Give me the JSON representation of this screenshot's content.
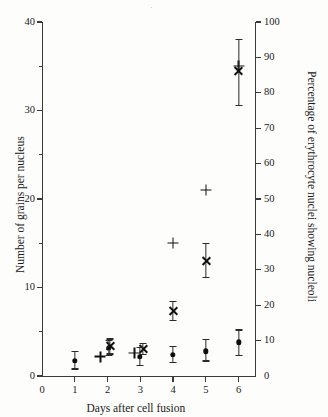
{
  "chart_data": {
    "type": "scatter",
    "title": "",
    "xlabel": "Days after cell fusion",
    "ylabel": "Number of grains per nucleus",
    "ylabel_right": "Percentage of erythrocyte nuclei showing nucleoli",
    "xlim": [
      0,
      6.5
    ],
    "ylim": [
      0,
      40
    ],
    "ylim_right": [
      0,
      100
    ],
    "x_ticks": [
      0,
      1,
      2,
      3,
      4,
      5,
      6
    ],
    "x_tick_labels": [
      "0",
      "1",
      "2",
      "3",
      "4",
      "5",
      "6"
    ],
    "y_ticks_left": [
      0,
      10,
      20,
      30,
      40
    ],
    "y_tick_labels_left": [
      "0",
      "10",
      "20",
      "30",
      "40"
    ],
    "y_minor_ticks_left": [
      5,
      15,
      25,
      35
    ],
    "y_ticks_right": [
      0,
      10,
      20,
      30,
      40,
      50,
      60,
      70,
      80,
      90,
      100
    ],
    "y_tick_labels_right": [
      "0",
      "10",
      "20",
      "30",
      "40",
      "50",
      "60",
      "70",
      "80",
      "90",
      "100"
    ],
    "grid": false,
    "legend": "none",
    "series": [
      {
        "name": "percentage-nucleoli",
        "marker": "plus",
        "axis": "right",
        "points": [
          {
            "x": 1.78,
            "y": 5.5
          },
          {
            "x": 2.82,
            "y": 6.5
          },
          {
            "x": 4.0,
            "y": 37.5
          },
          {
            "x": 5.0,
            "y": 52.5
          },
          {
            "x": 6.0,
            "y": 87.5
          }
        ]
      },
      {
        "name": "grains-cross",
        "marker": "cross",
        "axis": "left",
        "points": [
          {
            "x": 2.08,
            "y": 3.4,
            "err_low": 2.5,
            "err_high": 4.2
          },
          {
            "x": 3.08,
            "y": 3.0,
            "err_low": 2.4,
            "err_high": 3.7
          },
          {
            "x": 4.0,
            "y": 7.3,
            "err_low": 6.3,
            "err_high": 8.4
          },
          {
            "x": 5.0,
            "y": 13.0,
            "err_low": 11.1,
            "err_high": 15.0
          },
          {
            "x": 6.0,
            "y": 34.5,
            "err_low": 30.6,
            "err_high": 38.0
          }
        ]
      },
      {
        "name": "grains-filled-circle",
        "marker": "circle",
        "axis": "left",
        "points": [
          {
            "x": 1.0,
            "y": 1.7,
            "err_low": 0.8,
            "err_high": 2.8
          },
          {
            "x": 2.03,
            "y": 3.2,
            "err_low": 2.3,
            "err_high": 4.0
          },
          {
            "x": 2.98,
            "y": 2.2,
            "err_low": 1.2,
            "err_high": 3.2
          },
          {
            "x": 4.0,
            "y": 2.4,
            "err_low": 1.5,
            "err_high": 3.3
          },
          {
            "x": 5.0,
            "y": 2.8,
            "err_low": 1.7,
            "err_high": 4.1
          },
          {
            "x": 6.0,
            "y": 3.8,
            "err_low": 2.3,
            "err_high": 5.2
          }
        ]
      }
    ]
  }
}
